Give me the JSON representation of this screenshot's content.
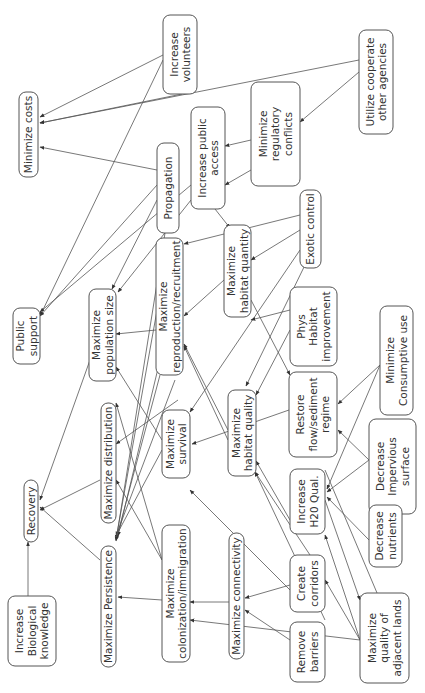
{
  "diagram": {
    "orientation": "rotated-90-ccw",
    "colors": {
      "stroke": "#555555",
      "text": "#333333",
      "background": "#ffffff"
    },
    "nodes": [
      {
        "id": "min_costs",
        "lines": [
          "Minimize costs"
        ],
        "box": [
          19,
          92,
          19,
          85
        ]
      },
      {
        "id": "inc_volunteers",
        "lines": [
          "Increase",
          "volunteers"
        ],
        "box": [
          163,
          15,
          34,
          79
        ]
      },
      {
        "id": "utilize_coop",
        "lines": [
          "Utilize cooperate",
          "other agencies"
        ],
        "box": [
          359,
          30,
          34,
          104
        ]
      },
      {
        "id": "min_reg",
        "lines": [
          "Minimize",
          "regulatory",
          "conflicts"
        ],
        "box": [
          251,
          82,
          49,
          104
        ]
      },
      {
        "id": "inc_public_access",
        "lines": [
          "Increase public",
          "access"
        ],
        "box": [
          191,
          107,
          34,
          102
        ]
      },
      {
        "id": "propagation",
        "lines": [
          "Propagation"
        ],
        "box": [
          157,
          143,
          22,
          90
        ]
      },
      {
        "id": "exotic",
        "lines": [
          "Exotic control"
        ],
        "box": [
          300,
          190,
          21,
          78
        ]
      },
      {
        "id": "public_support",
        "lines": [
          "Public",
          "support"
        ],
        "box": [
          13,
          308,
          27,
          56
        ]
      },
      {
        "id": "max_pop",
        "lines": [
          "Maximize",
          "population size"
        ],
        "box": [
          89,
          289,
          27,
          92
        ]
      },
      {
        "id": "max_repro",
        "lines": [
          "Maximize",
          "reproduction/recruitment"
        ],
        "box": [
          156,
          238,
          27,
          137
        ]
      },
      {
        "id": "max_hab_quantity",
        "lines": [
          "Maximize",
          "habitat quantity"
        ],
        "box": [
          224,
          225,
          27,
          92
        ]
      },
      {
        "id": "phys_hab",
        "lines": [
          "Phys",
          "Habitat",
          "improvement"
        ],
        "box": [
          290,
          287,
          47,
          79
        ]
      },
      {
        "id": "restore_flow",
        "lines": [
          "Restore",
          "flow/sediment",
          "regime"
        ],
        "box": [
          289,
          372,
          48,
          85
        ]
      },
      {
        "id": "min_consumptive",
        "lines": [
          "Minimize",
          "Consumptive use"
        ],
        "box": [
          380,
          306,
          33,
          109
        ]
      },
      {
        "id": "max_distribution",
        "lines": [
          "Maximize distribution"
        ],
        "box": [
          101,
          403,
          15,
          120
        ]
      },
      {
        "id": "max_survival",
        "lines": [
          "Maximize",
          "survival"
        ],
        "box": [
          162,
          410,
          28,
          68
        ]
      },
      {
        "id": "max_hab_quality",
        "lines": [
          "Maximize",
          "habitat quality"
        ],
        "box": [
          228,
          390,
          28,
          86
        ]
      },
      {
        "id": "dec_impervious",
        "lines": [
          "Decrease",
          "Impervious",
          "surface"
        ],
        "box": [
          369,
          419,
          47,
          95
        ]
      },
      {
        "id": "inc_h2o",
        "lines": [
          "Increase",
          "H20 Qual."
        ],
        "box": [
          290,
          469,
          35,
          65
        ]
      },
      {
        "id": "dec_nutrients",
        "lines": [
          "Decrease",
          "nutrients"
        ],
        "box": [
          369,
          505,
          33,
          62
        ]
      },
      {
        "id": "recovery",
        "lines": [
          "Recovery"
        ],
        "box": [
          24,
          480,
          14,
          62
        ]
      },
      {
        "id": "inc_bio",
        "lines": [
          "Increase",
          "Biological",
          "knowledge"
        ],
        "box": [
          8,
          596,
          48,
          70
        ]
      },
      {
        "id": "max_persistence",
        "lines": [
          "Maximize Persistence"
        ],
        "box": [
          101,
          546,
          15,
          121
        ]
      },
      {
        "id": "max_colonization",
        "lines": [
          "Maximize",
          "colonization/immigration"
        ],
        "box": [
          162,
          525,
          28,
          137
        ]
      },
      {
        "id": "max_connectivity",
        "lines": [
          "Maximize connectivity"
        ],
        "box": [
          229,
          533,
          15,
          126
        ]
      },
      {
        "id": "create_corridors",
        "lines": [
          "Create",
          "corridors"
        ],
        "box": [
          290,
          555,
          35,
          57
        ]
      },
      {
        "id": "remove_barriers",
        "lines": [
          "Remove",
          "barriers"
        ],
        "box": [
          290,
          622,
          35,
          60
        ]
      },
      {
        "id": "max_adjacent",
        "lines": [
          "Maximize",
          "quality of",
          "adjacent lands"
        ],
        "box": [
          360,
          593,
          49,
          90
        ]
      }
    ],
    "edges": [
      {
        "from": [
          163,
          55
        ],
        "to": [
          40,
          117
        ]
      },
      {
        "from": [
          182,
          94
        ],
        "to": [
          40,
          123
        ]
      },
      {
        "from": [
          359,
          60
        ],
        "to": [
          40,
          123
        ]
      },
      {
        "from": [
          157,
          170
        ],
        "to": [
          40,
          147
        ]
      },
      {
        "from": [
          359,
          72
        ],
        "to": [
          300,
          122
        ]
      },
      {
        "from": [
          251,
          140
        ],
        "to": [
          225,
          146
        ]
      },
      {
        "from": [
          251,
          170
        ],
        "to": [
          225,
          185
        ]
      },
      {
        "from": [
          163,
          60
        ],
        "to": [
          40,
          316
        ]
      },
      {
        "from": [
          191,
          185
        ],
        "to": [
          40,
          312
        ]
      },
      {
        "from": [
          157,
          185
        ],
        "to": [
          40,
          316
        ]
      },
      {
        "from": [
          157,
          200
        ],
        "to": [
          112,
          289
        ]
      },
      {
        "from": [
          191,
          200
        ],
        "to": [
          118,
          292
        ]
      },
      {
        "from": [
          300,
          230
        ],
        "to": [
          251,
          260
        ]
      },
      {
        "from": [
          300,
          215
        ],
        "to": [
          184,
          244
        ]
      },
      {
        "from": [
          224,
          280
        ],
        "to": [
          184,
          316
        ]
      },
      {
        "from": [
          156,
          330
        ],
        "to": [
          116,
          334
        ]
      },
      {
        "from": [
          215,
          209
        ],
        "to": [
          230,
          228
        ]
      },
      {
        "from": [
          300,
          250
        ],
        "to": [
          190,
          412
        ]
      },
      {
        "from": [
          305,
          265
        ],
        "to": [
          246,
          386
        ]
      },
      {
        "from": [
          290,
          330
        ],
        "to": [
          256,
          395
        ]
      },
      {
        "from": [
          290,
          310
        ],
        "to": [
          251,
          320
        ]
      },
      {
        "from": [
          289,
          410
        ],
        "to": [
          192,
          444
        ]
      },
      {
        "from": [
          251,
          300
        ],
        "to": [
          290,
          375
        ]
      },
      {
        "from": [
          380,
          365
        ],
        "to": [
          338,
          404
        ]
      },
      {
        "from": [
          380,
          365
        ],
        "to": [
          327,
          489
        ]
      },
      {
        "from": [
          369,
          460
        ],
        "to": [
          338,
          430
        ]
      },
      {
        "from": [
          369,
          460
        ],
        "to": [
          327,
          492
        ]
      },
      {
        "from": [
          369,
          540
        ],
        "to": [
          327,
          497
        ]
      },
      {
        "from": [
          290,
          520
        ],
        "to": [
          256,
          461
        ]
      },
      {
        "from": [
          228,
          430
        ],
        "to": [
          184,
          344
        ]
      },
      {
        "from": [
          228,
          440
        ],
        "to": [
          184,
          346
        ]
      },
      {
        "from": [
          162,
          440
        ],
        "to": [
          116,
          367
        ]
      },
      {
        "from": [
          178,
          400
        ],
        "to": [
          116,
          444
        ]
      },
      {
        "from": [
          162,
          450
        ],
        "to": [
          116,
          536
        ]
      },
      {
        "from": [
          175,
          380
        ],
        "to": [
          116,
          536
        ]
      },
      {
        "from": [
          160,
          360
        ],
        "to": [
          118,
          536
        ]
      },
      {
        "from": [
          160,
          375
        ],
        "to": [
          116,
          540
        ]
      },
      {
        "from": [
          170,
          238
        ],
        "to": [
          116,
          539
        ]
      },
      {
        "from": [
          165,
          233
        ],
        "to": [
          116,
          541
        ]
      },
      {
        "from": [
          162,
          600
        ],
        "to": [
          118,
          597
        ]
      },
      {
        "from": [
          162,
          560
        ],
        "to": [
          116,
          480
        ]
      },
      {
        "from": [
          162,
          560
        ],
        "to": [
          116,
          403
        ]
      },
      {
        "from": [
          229,
          602
        ],
        "to": [
          190,
          602
        ]
      },
      {
        "from": [
          290,
          585
        ],
        "to": [
          245,
          598
        ]
      },
      {
        "from": [
          290,
          640
        ],
        "to": [
          245,
          610
        ]
      },
      {
        "from": [
          360,
          640
        ],
        "to": [
          190,
          620
        ]
      },
      {
        "from": [
          290,
          590
        ],
        "to": [
          190,
          490
        ]
      },
      {
        "from": [
          360,
          640
        ],
        "to": [
          325,
          535
        ]
      },
      {
        "from": [
          360,
          640
        ],
        "to": [
          325,
          580
        ]
      },
      {
        "from": [
          325,
          620
        ],
        "to": [
          255,
          472
        ]
      },
      {
        "from": [
          310,
          555
        ],
        "to": [
          255,
          472
        ]
      },
      {
        "from": [
          100,
          560
        ],
        "to": [
          40,
          507
        ]
      },
      {
        "from": [
          100,
          480
        ],
        "to": [
          40,
          510
        ]
      },
      {
        "from": [
          90,
          360
        ],
        "to": [
          40,
          500
        ]
      },
      {
        "from": [
          28,
          596
        ],
        "to": [
          28,
          542
        ]
      },
      {
        "from": [
          325,
          470
        ],
        "to": [
          380,
          600
        ]
      },
      {
        "from": [
          325,
          500
        ],
        "to": [
          360,
          600
        ]
      }
    ]
  }
}
